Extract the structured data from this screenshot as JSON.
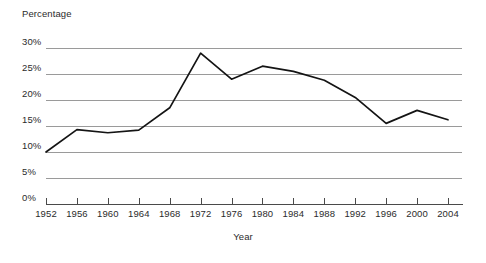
{
  "chart_data": {
    "type": "line",
    "title": "",
    "xlabel": "Year",
    "ylabel": "Percentage",
    "x": [
      1952,
      1956,
      1960,
      1964,
      1968,
      1972,
      1976,
      1980,
      1984,
      1988,
      1992,
      1996,
      2000,
      2004
    ],
    "categories": [
      "1952",
      "1956",
      "1960",
      "1964",
      "1968",
      "1972",
      "1976",
      "1980",
      "1984",
      "1988",
      "1992",
      "1996",
      "2000",
      "2004"
    ],
    "values": [
      10.0,
      14.3,
      13.7,
      14.2,
      18.5,
      29.0,
      24.0,
      26.5,
      25.5,
      23.8,
      20.5,
      15.5,
      18.0,
      16.2
    ],
    "value_labels": [
      "10.0%",
      "14.3%",
      "13.7%",
      "14.2%",
      "18.5%",
      "29.0%",
      "24.0%",
      "26.5%",
      "25.5%",
      "23.8%",
      "20.5%",
      "15.5%",
      "18.0%",
      "16.2%"
    ],
    "ylim": [
      0,
      30
    ],
    "xlim": [
      1952,
      2004
    ],
    "ytick_labels": [
      "0%",
      "5%",
      "10%",
      "15%",
      "20%",
      "25%",
      "30%"
    ],
    "ytick_values": [
      0,
      5,
      10,
      15,
      20,
      25,
      30
    ],
    "grid": true,
    "legend": "none",
    "series_color": "#141414",
    "gridline_color": "#9a9a9a",
    "axis_color": "#4a4a4a",
    "background_color": "#ffffff",
    "markers": false
  }
}
